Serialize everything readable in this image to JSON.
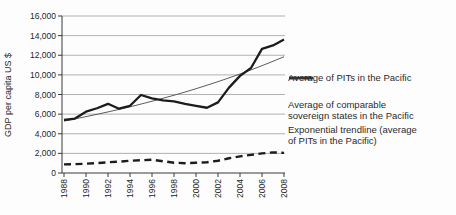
{
  "chart_data": {
    "type": "line",
    "title": "",
    "xlabel": "",
    "ylabel": "GDP per capita US $",
    "xlim": [
      1988,
      2008
    ],
    "ylim": [
      0,
      16000
    ],
    "grid": "horizontal",
    "legend_position": "right",
    "x": [
      1988,
      1989,
      1990,
      1991,
      1992,
      1993,
      1994,
      1995,
      1996,
      1997,
      1998,
      1999,
      2000,
      2001,
      2002,
      2003,
      2004,
      2005,
      2006,
      2007,
      2008
    ],
    "x_tick_labels": [
      "1988",
      "1990",
      "1992",
      "1994",
      "1996",
      "1998",
      "2000",
      "2002",
      "2004",
      "2006",
      "2008"
    ],
    "y_tick_values": [
      0,
      2000,
      4000,
      6000,
      8000,
      10000,
      12000,
      14000,
      16000
    ],
    "y_tick_labels": [
      "0",
      "2,000",
      "4,000",
      "6,000",
      "8,000",
      "10,000",
      "12,000",
      "14,000",
      "16,000"
    ],
    "series": [
      {
        "id": "trendline-exponential",
        "name": "Exponential trendline (average of PITs in the Pacific)",
        "style": "solid-thin",
        "values": [
          5300,
          5520,
          5745,
          5980,
          6225,
          6480,
          6745,
          7025,
          7315,
          7615,
          7925,
          8250,
          8590,
          8945,
          9310,
          9695,
          10090,
          10505,
          10935,
          11385,
          11850
        ]
      },
      {
        "id": "line-comparable-sovereign-states",
        "name": "Average of comparable sovereign states in the Pacific",
        "style": "dashed-thick",
        "values": [
          880,
          900,
          950,
          1000,
          1100,
          1150,
          1250,
          1300,
          1350,
          1200,
          1050,
          1000,
          1050,
          1100,
          1250,
          1500,
          1700,
          1850,
          2000,
          2100,
          2050
        ]
      },
      {
        "id": "line-average-pits",
        "name": "Average of PITs in the Pacific",
        "style": "solid-thick",
        "values": [
          5400,
          5550,
          6250,
          6600,
          7050,
          6550,
          6850,
          7950,
          7600,
          7400,
          7300,
          7050,
          6850,
          6650,
          7200,
          8700,
          9900,
          10700,
          12650,
          13000,
          13600
        ]
      }
    ],
    "colors": {
      "line": "#1c1c1c",
      "trendline": "#4a4a4a",
      "grid": "#919191",
      "axis": "#3a3a3a",
      "text": "#262626",
      "background": "#ffffff"
    }
  },
  "legend": {
    "items": [
      {
        "style": "solid-thick",
        "lines": [
          "Average of PITs in the Pacific"
        ]
      },
      {
        "style": "dashed-thick",
        "lines": [
          "Average of comparable",
          "sovereign states in the Pacific"
        ]
      },
      {
        "style": "solid-thin",
        "lines": [
          "Exponential trendline (average",
          "of PITs in the Pacific)"
        ]
      }
    ]
  }
}
